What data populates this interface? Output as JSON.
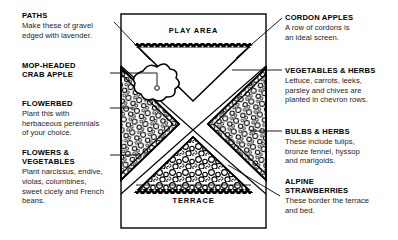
{
  "diagram": {
    "title_play_area": "PLAY AREA",
    "title_terrace": "TERRACE",
    "ink_color": "#000000",
    "paper_color": "#ffffff"
  },
  "callouts_left": [
    {
      "name": "paths",
      "title": "PATHS",
      "body": "Make these of gravel\nedged with lavender."
    },
    {
      "name": "mop-headed-crab-apple",
      "title": "MOP-HEADED\nCRAB APPLE",
      "body": ""
    },
    {
      "name": "flowerbed",
      "title": "FLOWERBED",
      "body": "Plant this with\nherbaceous perennials\nof your choice."
    },
    {
      "name": "flowers-and-vegetables",
      "title": "FLOWERS &\nVEGETABLES",
      "body": "Plant narcissus, endive,\nviolas, columbines,\nsweet cicely and French\nbeans."
    }
  ],
  "callouts_right": [
    {
      "name": "cordon-apples",
      "title": "CORDON APPLES",
      "body": "A row of cordons is\nan ideal screen."
    },
    {
      "name": "vegetables-and-herbs",
      "title": "VEGETABLES & HERBS",
      "body": "Lettuce, carrots, leeks,\nparsley and chives are\nplanted in chevron rows."
    },
    {
      "name": "bulbs-and-herbs",
      "title": "BULBS & HERBS",
      "body": "These include tulips,\nbronze fennel, hyssop\nand marigolds."
    },
    {
      "name": "alpine-strawberries",
      "title": "ALPINE\nSTRAWBERRIES",
      "body": "These border the terrace\nand bed."
    }
  ]
}
